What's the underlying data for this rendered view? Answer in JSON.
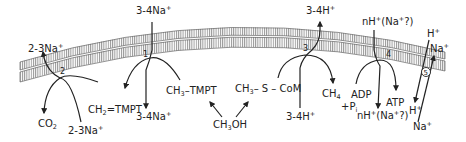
{
  "diagram": {
    "type": "membrane-transport-scheme",
    "membrane": {
      "hatch_color": "#9a9a9a",
      "line_color": "#555555"
    },
    "reactions": [
      {
        "id": "2",
        "number": "2",
        "inputs": [
          "CH2=TMPT",
          "2-3Na+ (in)"
        ],
        "outputs": [
          "CO2",
          "2-3Na+ (out)"
        ]
      },
      {
        "id": "1",
        "number": "1",
        "inputs": [
          "CH3-TMPT",
          "3-4Na+ (out)"
        ],
        "outputs": [
          "CH2=TMPT",
          "3-4Na+ (in)"
        ]
      },
      {
        "id": "3",
        "number": "3",
        "inputs": [
          "CH3-S-CoM",
          "3-4H+ (in)"
        ],
        "outputs": [
          "CH4",
          "3-4H+ (out)"
        ]
      },
      {
        "id": "4",
        "number": "4",
        "inputs": [
          "ADP + Pi",
          "nH+(Na+?) (out)"
        ],
        "outputs": [
          "ATP",
          "nH+(Na+?) (in)"
        ]
      },
      {
        "id": "5",
        "number": "5",
        "type": "antiporter",
        "exchange": [
          "H+",
          "Na+"
        ]
      }
    ],
    "labels": {
      "r2_out_top": {
        "main": "2-3Na",
        "sup": "+"
      },
      "r2_in_bottom": {
        "main": "2-3Na",
        "sup": "+"
      },
      "co2": {
        "main": "CO",
        "sub": "2"
      },
      "ch2_tmpt": {
        "pre": "CH",
        "sub": "2",
        "post": "=TMPT"
      },
      "r1_top": {
        "main": "3-4Na",
        "sup": "+"
      },
      "r1_bottom": {
        "main": "3-4Na",
        "sup": "+"
      },
      "ch3_tmpt": {
        "pre": "CH",
        "sub": "3",
        "post": "–TMPT"
      },
      "ch3oh": {
        "pre": "CH",
        "sub": "3",
        "post": "OH"
      },
      "ch3_s_com": {
        "pre": "CH",
        "sub": "3",
        "post": "– S – CoM"
      },
      "r3_top": {
        "main": "3-4H",
        "sup": "+"
      },
      "r3_bottom": {
        "main": "3-4H",
        "sup": "+"
      },
      "ch4": {
        "pre": "CH",
        "sub": "4"
      },
      "adp": "ADP",
      "pi": {
        "pre": "+P",
        "sub": "i"
      },
      "r4_top": {
        "pre": "nH",
        "sup1": "+",
        "mid": "(Na",
        "sup2": "+",
        "post": "?)"
      },
      "r4_bottom": {
        "pre": "nH",
        "sup1": "+",
        "mid": "(Na",
        "sup2": "+",
        "post": "?)"
      },
      "atp": "ATP",
      "r5_h_top": {
        "main": "H",
        "sup": "+"
      },
      "r5_na_top": {
        "main": "Na",
        "sup": "+"
      },
      "r5_h_bottom": {
        "main": "H",
        "sup": "+"
      },
      "r5_na_bottom": {
        "main": "Na",
        "sup": "+"
      }
    }
  }
}
